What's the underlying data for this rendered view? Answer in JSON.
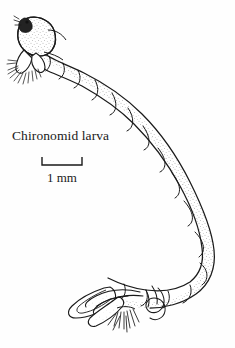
{
  "figure": {
    "subject_name": "Chironomid larva",
    "domain_kind": "scientific-line-illustration",
    "background_color": "#fefefe",
    "ink_color": "#1a1a1a",
    "stipple_color": "#5a5a5a",
    "width_px": 235,
    "height_px": 348
  },
  "caption": {
    "label": "Chironomid larva"
  },
  "scale": {
    "value": "1 mm",
    "bar_length_px": 40,
    "tick_direction": "up"
  },
  "anatomy": {
    "head_label": "head-capsule",
    "eye_label": "eye-spot",
    "antennae_label": "antennal-bristles",
    "body_label": "segmented-abdomen",
    "segment_count": 12,
    "anterior_prolegs_label": "anterior-prolegs",
    "posterior_prolegs_label": "posterior-prolegs",
    "anal_tubules_label": "anal-tubules",
    "tail_setae_label": "tail-setae",
    "filament_label": "looped-filament"
  }
}
